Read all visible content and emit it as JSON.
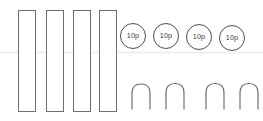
{
  "canvas": {
    "width": 263,
    "height": 121,
    "background": "#ffffff"
  },
  "divider": {
    "label": "faint horizontal guide line",
    "y": 52.5,
    "x1": 0,
    "x2": 263,
    "color": "#ececed"
  },
  "bars": {
    "group_label": "vertical bar strips",
    "count": 4,
    "fill": "#ffffff",
    "stroke": "#6e6e72",
    "items": [
      {
        "name": "bar-1",
        "x": 18.5,
        "y": 10.5,
        "width": 17,
        "height": 101
      },
      {
        "name": "bar-2",
        "x": 46.5,
        "y": 10.5,
        "width": 17,
        "height": 101
      },
      {
        "name": "bar-3",
        "x": 73.5,
        "y": 10.5,
        "width": 17,
        "height": 101
      },
      {
        "name": "bar-4",
        "x": 99.5,
        "y": 10.5,
        "width": 17,
        "height": 101
      }
    ]
  },
  "coins": {
    "group_label": "ten pence coins",
    "count": 4,
    "denomination": "10p",
    "fill": "#ffffff",
    "stroke": "#4e4e52",
    "items": [
      {
        "name": "coin-1",
        "cx": 133,
        "cy": 36,
        "r": 12.5,
        "label": "10p"
      },
      {
        "name": "coin-2",
        "cx": 166,
        "cy": 36,
        "r": 12.5,
        "label": "10p"
      },
      {
        "name": "coin-3",
        "cx": 199,
        "cy": 37,
        "r": 12.5,
        "label": "10p"
      },
      {
        "name": "coin-4",
        "cx": 232,
        "cy": 38,
        "r": 12.5,
        "label": "10p"
      }
    ]
  },
  "arches": {
    "group_label": "arch outline shapes",
    "count": 4,
    "stroke": "#6a6a70",
    "items": [
      {
        "name": "arch-1",
        "d": "M 132 109 L 132 93 Q 132 84 141 84 Q 150 84 150 93 L 150 109"
      },
      {
        "name": "arch-2",
        "d": "M 166 109 L 166 93 Q 166 83.5 175 83.5 Q 184 83.5 184 93 L 184 109"
      },
      {
        "name": "arch-3",
        "d": "M 206 109 L 206 93 Q 206 83.5 215 83.5 Q 224 83.5 224 93 L 224 109"
      },
      {
        "name": "arch-4",
        "d": "M 240 109 L 240 93 Q 240 83.5 249 83.5 Q 258 83.5 258 93 L 258 109"
      }
    ]
  }
}
